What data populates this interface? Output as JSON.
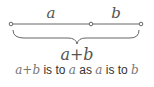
{
  "diagram": {
    "segment_a_label": "a",
    "segment_b_label": "b",
    "total_label": "a+b",
    "caption": {
      "parts": [
        "a+b",
        " is to ",
        "a",
        " as ",
        "a",
        " is to ",
        "b"
      ]
    },
    "colors": {
      "line": "#666666",
      "text": "#555555"
    }
  }
}
